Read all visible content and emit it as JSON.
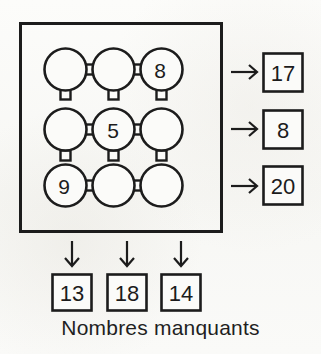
{
  "worksheet": {
    "caption": "Nombres manquants",
    "language": "fr",
    "ink_color": "#1c1c1c",
    "paper_color": "#fbfbf9"
  },
  "grid": {
    "rows": 3,
    "cols": 3,
    "cells": [
      {
        "row": 0,
        "col": 0,
        "value": ""
      },
      {
        "row": 0,
        "col": 1,
        "value": ""
      },
      {
        "row": 0,
        "col": 2,
        "value": "8"
      },
      {
        "row": 1,
        "col": 0,
        "value": ""
      },
      {
        "row": 1,
        "col": 1,
        "value": "5"
      },
      {
        "row": 1,
        "col": 2,
        "value": ""
      },
      {
        "row": 2,
        "col": 0,
        "value": "9"
      },
      {
        "row": 2,
        "col": 1,
        "value": ""
      },
      {
        "row": 2,
        "col": 2,
        "value": ""
      }
    ]
  },
  "row_totals": [
    {
      "index": 0,
      "value": "17",
      "arrow": "arrow-right"
    },
    {
      "index": 1,
      "value": "8",
      "arrow": "arrow-right"
    },
    {
      "index": 2,
      "value": "20",
      "arrow": "arrow-right"
    }
  ],
  "column_totals": [
    {
      "index": 0,
      "value": "13",
      "arrow": "arrow-down"
    },
    {
      "index": 1,
      "value": "18",
      "arrow": "arrow-down"
    },
    {
      "index": 2,
      "value": "14",
      "arrow": "arrow-down"
    }
  ]
}
